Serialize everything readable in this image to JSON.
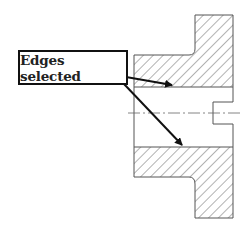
{
  "diagram": {
    "type": "section-view",
    "callout": {
      "text": "Edges selected",
      "arrow_count": 2
    },
    "colors": {
      "outline": "#555555",
      "hatch": "#666666",
      "arrow": "#111111",
      "centerline": "#666666",
      "background": "#ffffff"
    }
  }
}
